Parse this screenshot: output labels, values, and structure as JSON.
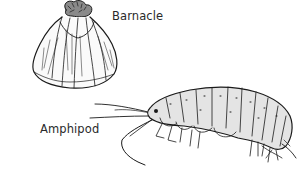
{
  "figure": {
    "specimens": [
      {
        "id": "barnacle",
        "label": "Barnacle"
      },
      {
        "id": "amphipod",
        "label": "Amphipod"
      }
    ]
  }
}
